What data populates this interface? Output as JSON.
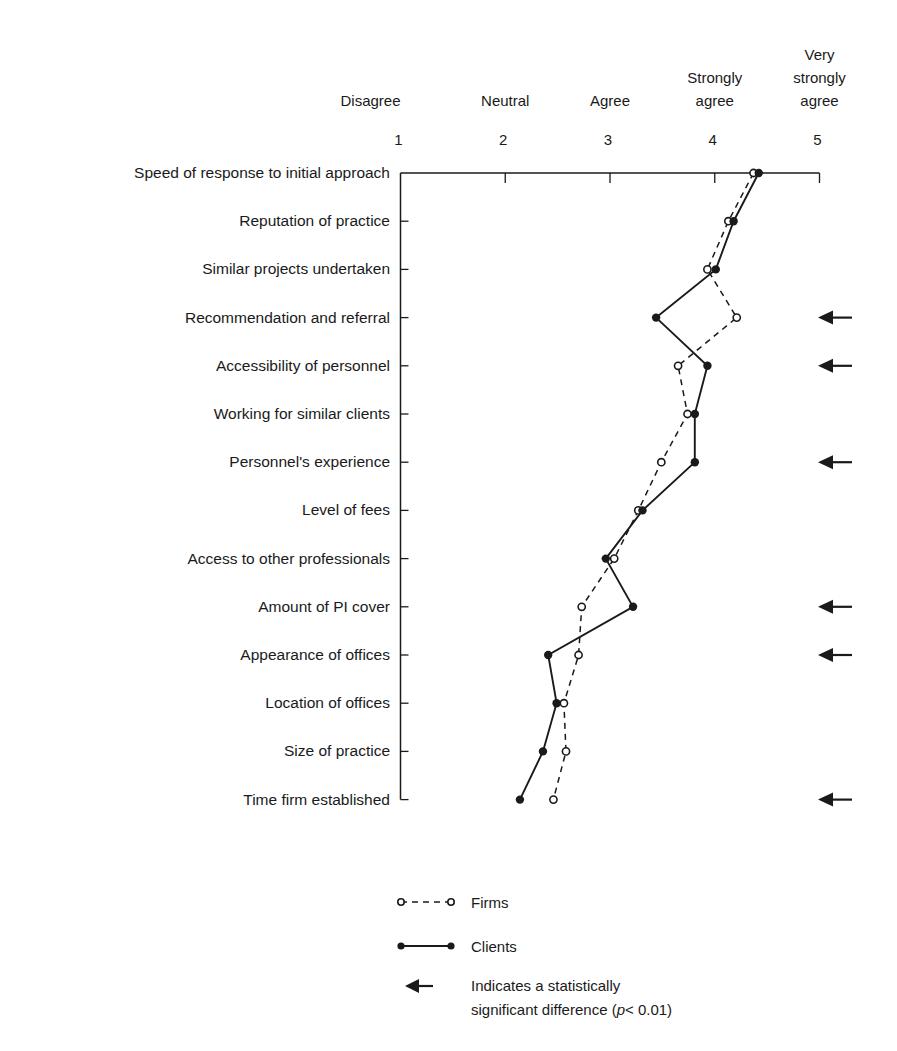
{
  "chart_data": {
    "type": "line",
    "orientation": "horizontal-profile",
    "title": "",
    "xlabel": "",
    "ylabel": "",
    "xlim": [
      1,
      5
    ],
    "x_ticks": [
      1,
      2,
      3,
      4,
      5
    ],
    "x_tick_descriptors": [
      "Disagree",
      "Neutral",
      "Agree",
      "Strongly agree",
      "Very strongly agree"
    ],
    "categories": [
      "Speed of response to initial approach",
      "Reputation of practice",
      "Similar projects undertaken",
      "Recommendation and referral",
      "Accessibility of personnel",
      "Working for similar clients",
      "Personnel's experience",
      "Level of fees",
      "Access to other professionals",
      "Amount of PI cover",
      "Appearance of offices",
      "Location of offices",
      "Size of practice",
      "Time firm established"
    ],
    "series": [
      {
        "name": "Firms",
        "style": "dashed",
        "marker": "open-circle",
        "values": [
          4.37,
          4.13,
          3.93,
          4.21,
          3.65,
          3.74,
          3.49,
          3.27,
          3.04,
          2.73,
          2.7,
          2.56,
          2.58,
          2.46
        ]
      },
      {
        "name": "Clients",
        "style": "solid",
        "marker": "filled-circle",
        "values": [
          4.42,
          4.18,
          4.01,
          3.44,
          3.93,
          3.81,
          3.81,
          3.31,
          2.96,
          3.22,
          2.41,
          2.49,
          2.36,
          2.14
        ]
      }
    ],
    "significant_difference": [
      false,
      false,
      false,
      true,
      true,
      false,
      true,
      false,
      false,
      true,
      true,
      false,
      false,
      true
    ],
    "grid": false,
    "legend_position": "bottom"
  },
  "header": {
    "descriptors": [
      {
        "lines": [
          "Disagree"
        ]
      },
      {
        "lines": [
          "Neutral"
        ]
      },
      {
        "lines": [
          "Agree"
        ]
      },
      {
        "lines": [
          "Strongly",
          "agree"
        ]
      },
      {
        "lines": [
          "Very",
          "strongly",
          "agree"
        ]
      }
    ],
    "tick_labels": [
      "1",
      "2",
      "3",
      "4",
      "5"
    ]
  },
  "legend": {
    "firms_label": "Firms",
    "clients_label": "Clients",
    "significance_line1": "Indicates a statistically",
    "significance_line2_prefix": "significant difference (",
    "significance_p": "p",
    "significance_line2_suffix": "< 0.01)"
  },
  "colors": {
    "ink": "#1a1a1a",
    "background": "#ffffff"
  }
}
